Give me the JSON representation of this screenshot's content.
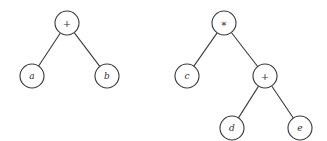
{
  "diagram": {
    "type": "expression-trees",
    "trees": [
      {
        "name": "tree-a-plus-b",
        "nodes": [
          {
            "id": "t1_root",
            "label": "+",
            "kind": "operator",
            "x": 67,
            "y": 23
          },
          {
            "id": "t1_a",
            "label": "a",
            "kind": "operand",
            "x": 32,
            "y": 76
          },
          {
            "id": "t1_b",
            "label": "b",
            "kind": "operand",
            "x": 107,
            "y": 76
          }
        ],
        "edges": [
          [
            "t1_root",
            "t1_a"
          ],
          [
            "t1_root",
            "t1_b"
          ]
        ]
      },
      {
        "name": "tree-c-times-d-plus-e",
        "nodes": [
          {
            "id": "t2_root",
            "label": "∗",
            "kind": "operator",
            "x": 224,
            "y": 23
          },
          {
            "id": "t2_c",
            "label": "c",
            "kind": "operand",
            "x": 187,
            "y": 76
          },
          {
            "id": "t2_plus",
            "label": "+",
            "kind": "operator",
            "x": 265,
            "y": 76
          },
          {
            "id": "t2_d",
            "label": "d",
            "kind": "operand",
            "x": 232,
            "y": 128
          },
          {
            "id": "t2_e",
            "label": "e",
            "kind": "operand",
            "x": 300,
            "y": 128
          }
        ],
        "edges": [
          [
            "t2_root",
            "t2_c"
          ],
          [
            "t2_root",
            "t2_plus"
          ],
          [
            "t2_plus",
            "t2_d"
          ],
          [
            "t2_plus",
            "t2_e"
          ]
        ]
      }
    ],
    "node_radius": 12,
    "stroke_color": "#3a3a3a",
    "text_color": "#333333",
    "background": "#ffffff"
  }
}
